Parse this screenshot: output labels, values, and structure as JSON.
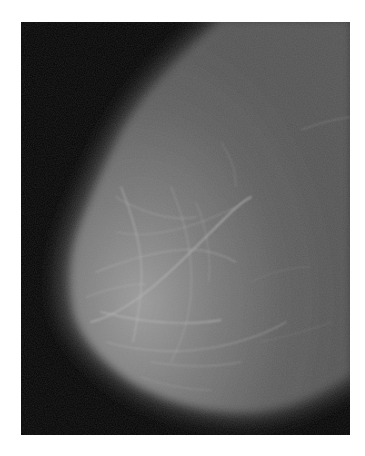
{
  "image": {
    "subject": "mammogram",
    "view": "breast-tissue-profile",
    "colors": {
      "page_background": "#ffffff",
      "film_background": "#050505",
      "tissue_base": "#5a5a5a",
      "tissue_bright": "#9a9a9a",
      "strand": "#b4b4b4"
    },
    "frame": {
      "x": 21,
      "y": 22,
      "width": 329,
      "height": 413
    }
  }
}
